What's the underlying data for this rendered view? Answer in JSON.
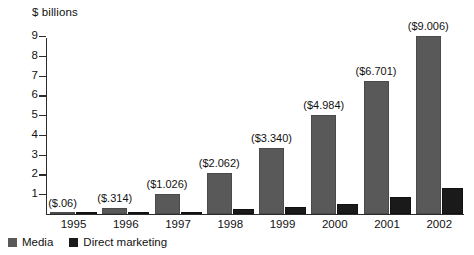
{
  "chart_data": {
    "type": "bar",
    "title": "",
    "subtitle": "",
    "xlabel": "",
    "ylabel": "$ billions",
    "ylim": [
      0,
      9
    ],
    "yticks": [
      1,
      2,
      3,
      4,
      5,
      6,
      7,
      8,
      9
    ],
    "grid": false,
    "legend_position": "bottom-left",
    "categories": [
      "1995",
      "1996",
      "1997",
      "1998",
      "1999",
      "2000",
      "2001",
      "2002"
    ],
    "series": [
      {
        "name": "Media",
        "color": "#595959",
        "values": [
          0.06,
          0.314,
          1.026,
          2.062,
          3.34,
          4.984,
          6.701,
          9.006
        ],
        "data_labels": [
          "($.06)",
          "($.314)",
          "($1.026)",
          "($2.062)",
          "($3.340)",
          "($4.984)",
          "($6.701)",
          "($9.006)"
        ]
      },
      {
        "name": "Direct marketing",
        "color": "#1a1a1a",
        "values": [
          0.02,
          0.05,
          0.08,
          0.25,
          0.35,
          0.5,
          0.85,
          1.3
        ],
        "data_labels": [
          "",
          "",
          "",
          "",
          "",
          "",
          "",
          ""
        ]
      }
    ]
  },
  "legend": {
    "items": [
      {
        "label": "Media",
        "color": "#595959"
      },
      {
        "label": "Direct marketing",
        "color": "#1a1a1a"
      }
    ]
  }
}
